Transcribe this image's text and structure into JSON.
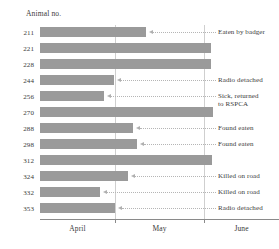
{
  "chart_data": {
    "type": "bar",
    "orientation": "horizontal",
    "title": "",
    "ylabel": "Animal no.",
    "xlabel": "",
    "grid": true,
    "legend": false,
    "x_tick_labels": [
      "April",
      "May",
      "June"
    ],
    "x_axis_note": "timeline of radio-tracking duration, April through June",
    "categories": [
      "211",
      "221",
      "228",
      "244",
      "256",
      "270",
      "288",
      "298",
      "312",
      "324",
      "332",
      "353"
    ],
    "values": [
      60,
      97,
      97,
      42,
      36,
      98,
      53,
      55,
      98,
      50,
      34,
      43
    ],
    "value_units": "days tracked from 1 April (bar length)",
    "bars": [
      {
        "animal": "211",
        "end_px": 146,
        "value": 60,
        "annotation": "Eaten by badger"
      },
      {
        "animal": "221",
        "end_px": 211,
        "value": 97,
        "annotation": ""
      },
      {
        "animal": "228",
        "end_px": 211,
        "value": 97,
        "annotation": ""
      },
      {
        "animal": "244",
        "end_px": 114,
        "value": 42,
        "annotation": "Radio detached"
      },
      {
        "animal": "256",
        "end_px": 104,
        "value": 36,
        "annotation": "Sick, returned\nto RSPCA"
      },
      {
        "animal": "270",
        "end_px": 213,
        "value": 98,
        "annotation": ""
      },
      {
        "animal": "288",
        "end_px": 133,
        "value": 53,
        "annotation": "Found eaten"
      },
      {
        "animal": "298",
        "end_px": 137,
        "value": 55,
        "annotation": "Found eaten"
      },
      {
        "animal": "312",
        "end_px": 212,
        "value": 98,
        "annotation": ""
      },
      {
        "animal": "324",
        "end_px": 128,
        "value": 50,
        "annotation": "Killed on road"
      },
      {
        "animal": "332",
        "end_px": 100,
        "value": 34,
        "annotation": "Killed on road"
      },
      {
        "animal": "353",
        "end_px": 115,
        "value": 43,
        "annotation": "Radio detached"
      }
    ],
    "colors": {
      "bar": "#9a9a9a",
      "gridline": "#cfcfcf",
      "axis": "#8a8a8a",
      "text": "#3a3a3a",
      "leader": "#b5b5b5"
    }
  },
  "axis": {
    "y_title": "Animal no.",
    "x_ticks": [
      {
        "label": "April"
      },
      {
        "label": "May"
      },
      {
        "label": "June"
      }
    ]
  }
}
